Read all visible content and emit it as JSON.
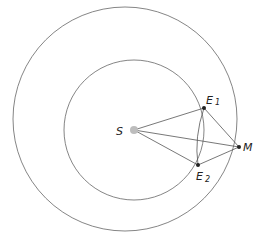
{
  "diagram": {
    "orbits": [
      {
        "name": "outer-orbit",
        "cx": 125,
        "cy": 119,
        "r": 112
      },
      {
        "name": "inner-orbit",
        "cx": 134,
        "cy": 130,
        "r": 70
      }
    ],
    "bodies": {
      "sun": {
        "label": "S",
        "x": 134,
        "y": 130,
        "color": "#bdbdbd"
      },
      "earth1": {
        "label": "E",
        "sub": "1",
        "x": 204,
        "y": 108
      },
      "earth2": {
        "label": "E",
        "sub": "2",
        "x": 198,
        "y": 165
      },
      "mars": {
        "label": "M",
        "x": 239,
        "y": 147
      }
    },
    "line_color": "#555555"
  }
}
